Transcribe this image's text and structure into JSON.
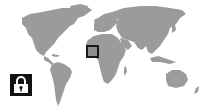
{
  "map": {
    "type": "world-map",
    "land_color": "#9b9b9b",
    "background_color": "#ffffff",
    "marker": {
      "region": "West Africa",
      "shape": "square",
      "border_color": "#1a1a1a",
      "fill_color": "#8f8f8f"
    }
  },
  "icons": {
    "lock": {
      "name": "lock-icon",
      "state": "locked",
      "background": "#111111",
      "foreground": "#ffffff"
    }
  }
}
